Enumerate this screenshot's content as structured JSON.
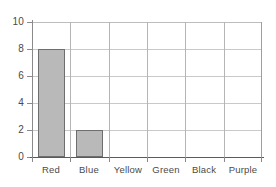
{
  "chart_data": {
    "type": "bar",
    "title": "",
    "subtitle": "",
    "xlabel": "",
    "ylabel": "",
    "categories": [
      "Red",
      "Blue",
      "Yellow",
      "Green",
      "Black",
      "Purple"
    ],
    "values": [
      8,
      2,
      0,
      0,
      0,
      0
    ],
    "ylim": [
      0,
      10
    ],
    "ytick_labels": [
      "0",
      "2",
      "4",
      "6",
      "8",
      "10"
    ],
    "ytick_values": [
      0,
      2,
      4,
      6,
      8,
      10
    ],
    "grid": true,
    "legend": false,
    "legend_position": "none",
    "bar_fill_color": "#b9b9b9",
    "bar_border_color": "#6e6e6e",
    "grid_color": "#c9c9c9",
    "axis_color": "#5a5a5a",
    "text_color": "#4a4a4a",
    "background_color": "#ffffff"
  }
}
